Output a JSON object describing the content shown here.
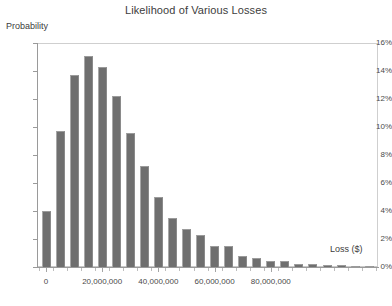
{
  "chart_data": {
    "type": "bar",
    "title": "Likelihood of Various Losses",
    "xlabel": "Loss ($)",
    "ylabel": "Probability",
    "grid": false,
    "legend": "none",
    "ylim": [
      0,
      16
    ],
    "yticks": [
      "0%",
      "2%",
      "4%",
      "6%",
      "8%",
      "10%",
      "12%",
      "14%",
      "16%"
    ],
    "ytick_values": [
      0,
      2,
      4,
      6,
      8,
      10,
      12,
      14,
      16
    ],
    "xlim": [
      -2500000,
      95000000
    ],
    "xticks": [
      "0",
      "20,000,000",
      "40,000,000",
      "60,000,000",
      "80,000,000"
    ],
    "xtick_values": [
      0,
      20000000,
      40000000,
      60000000,
      80000000
    ],
    "categories": [
      "0",
      "5,000,000",
      "10,000,000",
      "15,000,000",
      "20,000,000",
      "25,000,000",
      "30,000,000",
      "35,000,000",
      "40,000,000",
      "45,000,000",
      "50,000,000",
      "55,000,000",
      "60,000,000",
      "65,000,000",
      "70,000,000",
      "75,000,000",
      "80,000,000",
      "85,000,000",
      "90,000,000",
      "95,000,000",
      "100,000,000",
      "105,000,000",
      "110,000,000",
      "115,000,000"
    ],
    "values": [
      4.0,
      9.7,
      13.7,
      15.1,
      14.3,
      12.2,
      9.6,
      7.2,
      5.0,
      3.5,
      2.7,
      2.3,
      1.5,
      1.5,
      0.8,
      0.65,
      0.45,
      0.4,
      0.25,
      0.2,
      0.15,
      0.12,
      0.1,
      0.08
    ]
  }
}
